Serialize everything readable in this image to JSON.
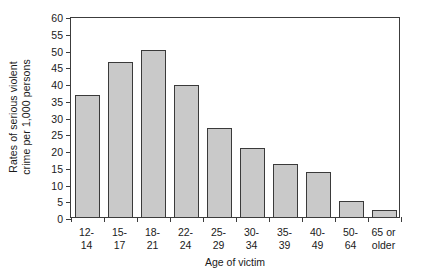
{
  "chart_data": {
    "type": "bar",
    "title": "",
    "xlabel": "Age of victim",
    "ylabel": "Rates of serious violent crime per 1,000 persons",
    "ylabel_lines": [
      "Rates of  serious violent",
      "crime per 1,000 persons"
    ],
    "categories": [
      "12-\n14",
      "15-\n17",
      "18-\n21",
      "22-\n24",
      "25-\n29",
      "30-\n34",
      "35-\n39",
      "40-\n49",
      "50-\n64",
      "65 or\nolder"
    ],
    "category_lines": [
      [
        "12-",
        "14"
      ],
      [
        "15-",
        "17"
      ],
      [
        "18-",
        "21"
      ],
      [
        "22-",
        "24"
      ],
      [
        "25-",
        "29"
      ],
      [
        "30-",
        "34"
      ],
      [
        "35-",
        "39"
      ],
      [
        "40-",
        "49"
      ],
      [
        "50-",
        "64"
      ],
      [
        "65 or",
        "older"
      ]
    ],
    "values": [
      36.5,
      46.3,
      50.0,
      39.3,
      26.5,
      20.5,
      15.7,
      13.4,
      4.8,
      2.0
    ],
    "ylim": [
      0,
      60
    ],
    "yticks": [
      0,
      5,
      10,
      15,
      20,
      25,
      30,
      35,
      40,
      45,
      50,
      55,
      60
    ],
    "ytick_labels": [
      "0",
      "5",
      "10",
      "15",
      "20",
      "25",
      "30",
      "35",
      "40",
      "45",
      "50",
      "55",
      "60"
    ],
    "grid": false,
    "legend": null,
    "bar_fill_color": "#c9c9c9",
    "bar_edge_color": "#3a3a3a",
    "axis_color": "#3c3c3c",
    "background_color": "#ffffff"
  }
}
